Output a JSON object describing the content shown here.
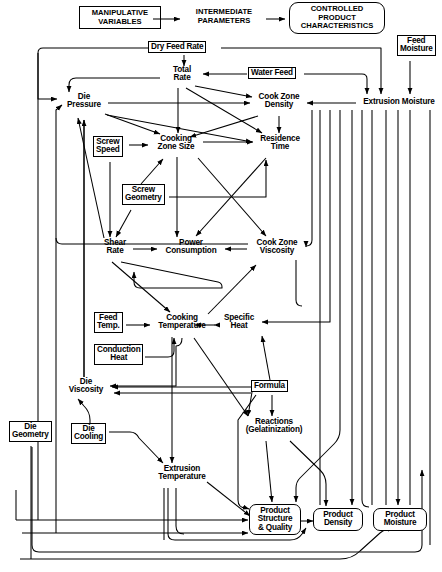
{
  "diagram": {
    "legend": {
      "manipulative": "MANIPULATIVE\nVARIABLES",
      "manipulative_l1": "MANIPULATIVE",
      "manipulative_l2": "VARIABLES",
      "intermediate_l1": "INTERMEDIATE",
      "intermediate_l2": "PARAMETERS",
      "controlled_l1": "CONTROLLED",
      "controlled_l2": "PRODUCT",
      "controlled_l3": "CHARACTERISTICS"
    },
    "nodes": [
      {
        "id": "dry_feed_rate",
        "label": "Dry Feed Rate",
        "kind": "boxed",
        "x": 148,
        "y": 42,
        "w": 72,
        "h": 13
      },
      {
        "id": "feed_moisture",
        "label": "Feed\nMoisture",
        "l1": "Feed",
        "l2": "Moisture",
        "kind": "boxed",
        "x": 398,
        "y": 36,
        "w": 40,
        "h": 24
      },
      {
        "id": "water_feed",
        "label": "Water Feed",
        "kind": "boxed",
        "x": 248,
        "y": 68,
        "w": 56,
        "h": 13
      },
      {
        "id": "total_rate",
        "label": "Total\nRate",
        "l1": "Total",
        "l2": "Rate",
        "kind": "txt",
        "x": 160,
        "y": 67,
        "w": 40,
        "h": 20
      },
      {
        "id": "die_pressure",
        "label": "Die\nPressure",
        "l1": "Die",
        "l2": "Pressure",
        "kind": "txt",
        "x": 58,
        "y": 94,
        "w": 48,
        "h": 20
      },
      {
        "id": "cook_zone_density",
        "label": "Cook Zone\nDensity",
        "l1": "Cook Zone",
        "l2": "Density",
        "kind": "txt",
        "x": 252,
        "y": 94,
        "w": 52,
        "h": 20
      },
      {
        "id": "extrusion_moisture",
        "label": "Extrusion Moisture",
        "kind": "txt",
        "x": 358,
        "y": 98,
        "w": 84,
        "h": 11
      },
      {
        "id": "screw_speed",
        "label": "Screw\nSpeed",
        "l1": "Screw",
        "l2": "Speed",
        "kind": "boxed",
        "x": 93,
        "y": 137,
        "w": 35,
        "h": 24
      },
      {
        "id": "cooking_zone_size",
        "label": "Cooking\nZone Size",
        "l1": "Cooking",
        "l2": "Zone Size",
        "kind": "txt",
        "x": 150,
        "y": 136,
        "w": 52,
        "h": 20
      },
      {
        "id": "residence_time",
        "label": "Residence\nTime",
        "l1": "Residence",
        "l2": "Time",
        "kind": "txt",
        "x": 255,
        "y": 136,
        "w": 50,
        "h": 20
      },
      {
        "id": "screw_geometry",
        "label": "Screw\nGeometry",
        "l1": "Screw",
        "l2": "Geometry",
        "kind": "boxed",
        "x": 123,
        "y": 185,
        "w": 45,
        "h": 24
      },
      {
        "id": "shear_rate",
        "label": "Shear\nRate",
        "l1": "Shear",
        "l2": "Rate",
        "kind": "txt",
        "x": 95,
        "y": 240,
        "w": 36,
        "h": 20
      },
      {
        "id": "power_consumption",
        "label": "Power\nConsumption",
        "l1": "Power",
        "l2": "Consumption",
        "kind": "txt",
        "x": 160,
        "y": 240,
        "w": 62,
        "h": 20
      },
      {
        "id": "cook_zone_viscosity",
        "label": "Cook Zone\nViscosity",
        "l1": "Cook Zone",
        "l2": "Viscosity",
        "kind": "txt",
        "x": 249,
        "y": 240,
        "w": 54,
        "h": 20
      },
      {
        "id": "feed_temp",
        "label": "Feed\nTemp.",
        "l1": "Feed",
        "l2": "Temp.",
        "kind": "boxed",
        "x": 94,
        "y": 313,
        "w": 31,
        "h": 24
      },
      {
        "id": "cooking_temperature",
        "label": "Cooking\nTemperature",
        "l1": "Cooking",
        "l2": "Temperature",
        "kind": "txt",
        "x": 152,
        "y": 315,
        "w": 60,
        "h": 20
      },
      {
        "id": "specific_heat",
        "label": "Specific\nHeat",
        "l1": "Specific",
        "l2": "Heat",
        "kind": "txt",
        "x": 216,
        "y": 315,
        "w": 42,
        "h": 20
      },
      {
        "id": "conduction_heat",
        "label": "Conduction\nHeat",
        "l1": "Conduction",
        "l2": "Heat",
        "kind": "boxed",
        "x": 94,
        "y": 345,
        "w": 50,
        "h": 24
      },
      {
        "id": "formula",
        "label": "Formula",
        "kind": "boxed",
        "x": 252,
        "y": 381,
        "w": 40,
        "h": 13
      },
      {
        "id": "die_viscosity",
        "label": "Die\nViscosity",
        "l1": "Die",
        "l2": "Viscosity",
        "kind": "txt",
        "x": 60,
        "y": 379,
        "w": 48,
        "h": 20
      },
      {
        "id": "die_geometry",
        "label": "Die\nGeometry",
        "l1": "Die",
        "l2": "Geometry",
        "kind": "boxed",
        "x": 10,
        "y": 422,
        "w": 42,
        "h": 24
      },
      {
        "id": "die_cooling",
        "label": "Die\nCooling",
        "l1": "Die",
        "l2": "Cooling",
        "kind": "boxed",
        "x": 72,
        "y": 424,
        "w": 36,
        "h": 24
      },
      {
        "id": "reactions",
        "label": "Reactions\n(Gelatinization)",
        "l1": "Reactions",
        "l2": "(Gelatinization)",
        "kind": "txt",
        "x": 240,
        "y": 419,
        "w": 68,
        "h": 20
      },
      {
        "id": "extrusion_temperature",
        "label": "Extrusion\nTemperature",
        "l1": "Extrusion",
        "l2": "Temperature",
        "kind": "txt",
        "x": 152,
        "y": 466,
        "w": 60,
        "h": 20
      },
      {
        "id": "product_structure",
        "label": "Product\nStructure\n& Quality",
        "l1": "Product",
        "l2": "Structure",
        "l3": "& Quality",
        "kind": "rounded",
        "x": 251,
        "y": 505,
        "w": 46,
        "h": 36
      },
      {
        "id": "product_density",
        "label": "Product\nDensity",
        "l1": "Product",
        "l2": "Density",
        "kind": "rounded",
        "x": 315,
        "y": 509,
        "w": 42,
        "h": 27
      },
      {
        "id": "product_moisture",
        "label": "Product\nMoisture",
        "l1": "Product",
        "l2": "Moisture",
        "kind": "rounded",
        "x": 375,
        "y": 509,
        "w": 44,
        "h": 27
      }
    ],
    "edges": [
      {
        "from": "dry_feed_rate",
        "to": "total_rate"
      },
      {
        "from": "dry_feed_rate",
        "to": "extrusion_moisture"
      },
      {
        "from": "dry_feed_rate",
        "to": "die_pressure"
      },
      {
        "from": "water_feed",
        "to": "total_rate"
      },
      {
        "from": "water_feed",
        "to": "extrusion_moisture"
      },
      {
        "from": "feed_moisture",
        "to": "extrusion_moisture"
      },
      {
        "from": "total_rate",
        "to": "die_pressure"
      },
      {
        "from": "total_rate",
        "to": "cooking_zone_size"
      },
      {
        "from": "total_rate",
        "to": "residence_time"
      },
      {
        "from": "total_rate",
        "to": "cook_zone_density"
      },
      {
        "from": "cook_zone_density",
        "to": "cooking_zone_size"
      },
      {
        "from": "cook_zone_density",
        "to": "residence_time"
      },
      {
        "from": "die_pressure",
        "to": "cooking_zone_size"
      },
      {
        "from": "die_pressure",
        "to": "cook_zone_density"
      },
      {
        "from": "die_pressure",
        "to": "shear_rate"
      },
      {
        "from": "screw_speed",
        "to": "cooking_zone_size"
      },
      {
        "from": "screw_speed",
        "to": "shear_rate"
      },
      {
        "from": "screw_geometry",
        "to": "cooking_zone_size"
      },
      {
        "from": "screw_geometry",
        "to": "shear_rate"
      },
      {
        "from": "screw_geometry",
        "to": "residence_time"
      },
      {
        "from": "cooking_zone_size",
        "to": "residence_time"
      },
      {
        "from": "cooking_zone_size",
        "to": "power_consumption"
      },
      {
        "from": "cooking_zone_size",
        "to": "cook_zone_viscosity"
      },
      {
        "from": "shear_rate",
        "to": "power_consumption"
      },
      {
        "from": "shear_rate",
        "to": "cooking_temperature"
      },
      {
        "from": "shear_rate",
        "to": "cook_zone_viscosity"
      },
      {
        "from": "cook_zone_viscosity",
        "to": "power_consumption"
      },
      {
        "from": "cook_zone_viscosity",
        "to": "die_pressure"
      },
      {
        "from": "cook_zone_viscosity",
        "to": "cooking_temperature"
      },
      {
        "from": "extrusion_moisture",
        "to": "cook_zone_density"
      },
      {
        "from": "extrusion_moisture",
        "to": "cook_zone_viscosity"
      },
      {
        "from": "extrusion_moisture",
        "to": "specific_heat"
      },
      {
        "from": "extrusion_moisture",
        "to": "reactions"
      },
      {
        "from": "extrusion_moisture",
        "to": "product_moisture"
      },
      {
        "from": "feed_temp",
        "to": "cooking_temperature"
      },
      {
        "from": "conduction_heat",
        "to": "cooking_temperature"
      },
      {
        "from": "specific_heat",
        "to": "cooking_temperature"
      },
      {
        "from": "cooking_temperature",
        "to": "cook_zone_viscosity"
      },
      {
        "from": "cooking_temperature",
        "to": "die_viscosity"
      },
      {
        "from": "cooking_temperature",
        "to": "extrusion_temperature"
      },
      {
        "from": "cooking_temperature",
        "to": "reactions"
      },
      {
        "from": "formula",
        "to": "specific_heat"
      },
      {
        "from": "formula",
        "to": "die_viscosity"
      },
      {
        "from": "formula",
        "to": "reactions"
      },
      {
        "from": "formula",
        "to": "product_structure"
      },
      {
        "from": "die_viscosity",
        "to": "die_pressure"
      },
      {
        "from": "die_cooling",
        "to": "extrusion_temperature"
      },
      {
        "from": "die_geometry",
        "to": "die_pressure"
      },
      {
        "from": "die_geometry",
        "to": "product_structure"
      },
      {
        "from": "reactions",
        "to": "product_structure"
      },
      {
        "from": "reactions",
        "to": "product_density"
      },
      {
        "from": "extrusion_temperature",
        "to": "product_structure"
      },
      {
        "from": "extrusion_temperature",
        "to": "product_density"
      },
      {
        "from": "product_structure",
        "to": "product_density"
      }
    ]
  }
}
